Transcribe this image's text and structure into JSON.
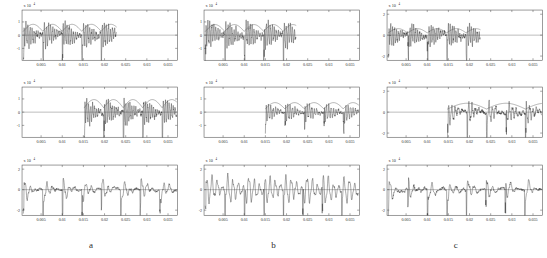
{
  "figure": {
    "columns": [
      {
        "label": "a"
      },
      {
        "label": "b"
      },
      {
        "label": "c"
      }
    ]
  },
  "axis": {
    "x_ticks": [
      "0.005",
      "0.01",
      "0.015",
      "0.02",
      "0.025",
      "0.03",
      "0.035"
    ],
    "x_tick_values": [
      0.005,
      0.01,
      0.015,
      0.02,
      0.025,
      0.03,
      0.035
    ],
    "xlim": [
      0.0005,
      0.0372
    ],
    "y_multiplier": "x 10",
    "y_exponent": "4",
    "y_ticks_pm1": [
      "1",
      "0",
      "-1"
    ],
    "y_ticks_pm2": [
      "2",
      "0",
      "-2"
    ]
  },
  "chart_data": [
    {
      "id": "a1",
      "type": "line",
      "title": "",
      "xlabel": "",
      "ylabel": "",
      "xlim": [
        0.0005,
        0.0372
      ],
      "ylim": [
        -1.9,
        1.9
      ],
      "ytick_labels": [
        "1",
        "0",
        "-1"
      ],
      "ytick_values": [
        1,
        0,
        -1
      ],
      "xtick_labels": [
        "0.005",
        "0.01",
        "0.015",
        "0.02",
        "0.025",
        "0.03",
        "0.035"
      ],
      "y_multiplier_text": "x 10",
      "y_exponent_text": "4",
      "grid": false,
      "legend": null,
      "series": [
        {
          "name": "signal",
          "span": [
            0.0008,
            0.0228
          ],
          "amplitude": 1.45,
          "carrier_hz": 2050,
          "impulse_period": 0.0046,
          "decay": 0.45,
          "noise": 0.3
        },
        {
          "name": "envelope",
          "span": [
            0.0008,
            0.0228
          ],
          "amplitude": 0.82,
          "lobe_period": 0.0046
        }
      ]
    },
    {
      "id": "a2",
      "type": "line",
      "xlim": [
        0.0005,
        0.0372
      ],
      "ylim": [
        -1.9,
        1.9
      ],
      "ytick_labels": [
        "1",
        "0",
        "-1"
      ],
      "ytick_values": [
        1,
        0,
        -1
      ],
      "xtick_labels": [
        "0.005",
        "0.01",
        "0.015",
        "0.02",
        "0.025",
        "0.03",
        "0.035"
      ],
      "y_multiplier_text": "x 10",
      "y_exponent_text": "4",
      "grid": false,
      "series": [
        {
          "name": "signal",
          "span": [
            0.0152,
            0.037
          ],
          "amplitude": 1.5,
          "carrier_hz": 2150,
          "impulse_period": 0.0046,
          "decay": 0.4,
          "noise": 0.32
        },
        {
          "name": "envelope",
          "span": [
            0.0152,
            0.037
          ],
          "amplitude": 0.95,
          "lobe_period": 0.0046
        }
      ]
    },
    {
      "id": "a3",
      "type": "line",
      "xlim": [
        0.0005,
        0.0372
      ],
      "ylim": [
        -2.5,
        2.4
      ],
      "ytick_labels": [
        "2",
        "0",
        "-2"
      ],
      "ytick_values": [
        2,
        0,
        -2
      ],
      "xtick_labels": [
        "0.005",
        "0.01",
        "0.015",
        "0.02",
        "0.025",
        "0.03",
        "0.035"
      ],
      "y_multiplier_text": "x 10",
      "y_exponent_text": "4",
      "grid": false,
      "series": [
        {
          "name": "signal",
          "span": [
            0.0008,
            0.037
          ],
          "amplitude": 1.85,
          "carrier_hz": 760,
          "impulse_period": 0.0046,
          "decay": 0.25,
          "noise": 0.26
        }
      ]
    },
    {
      "id": "b1",
      "type": "line",
      "xlim": [
        0.0005,
        0.0372
      ],
      "ylim": [
        -1.9,
        1.9
      ],
      "ytick_labels": [
        "1",
        "0",
        "-1"
      ],
      "ytick_values": [
        1,
        0,
        -1
      ],
      "xtick_labels": [
        "0.005",
        "0.01",
        "0.015",
        "0.02",
        "0.025",
        "0.03",
        "0.035"
      ],
      "y_multiplier_text": "x 10",
      "y_exponent_text": "4",
      "grid": false,
      "series": [
        {
          "name": "signal",
          "span": [
            0.0008,
            0.0222
          ],
          "amplitude": 1.48,
          "carrier_hz": 2100,
          "impulse_period": 0.0046,
          "decay": 0.46,
          "noise": 0.3
        },
        {
          "name": "envelope",
          "span": [
            0.0008,
            0.0222
          ],
          "amplitude": 0.8,
          "lobe_period": 0.0046
        }
      ]
    },
    {
      "id": "b2",
      "type": "line",
      "xlim": [
        0.0005,
        0.0372
      ],
      "ylim": [
        -1.9,
        1.9
      ],
      "ytick_labels": [
        "1",
        "0",
        "-1"
      ],
      "ytick_values": [
        1,
        0,
        -1
      ],
      "xtick_labels": [
        "0.005",
        "0.01",
        "0.015",
        "0.02",
        "0.025",
        "0.03",
        "0.035"
      ],
      "y_multiplier_text": "x 10",
      "y_exponent_text": "4",
      "grid": false,
      "series": [
        {
          "name": "signal",
          "span": [
            0.015,
            0.037
          ],
          "amplitude": 1.1,
          "carrier_hz": 1750,
          "impulse_period": 0.0046,
          "decay": 0.38,
          "noise": 0.24
        },
        {
          "name": "envelope",
          "span": [
            0.015,
            0.037
          ],
          "amplitude": 0.72,
          "lobe_period": 0.0046
        }
      ]
    },
    {
      "id": "b3",
      "type": "line",
      "xlim": [
        0.0005,
        0.0372
      ],
      "ylim": [
        -2.5,
        2.4
      ],
      "ytick_labels": [
        "2",
        "0",
        "-2"
      ],
      "ytick_values": [
        2,
        0,
        -2
      ],
      "xtick_labels": [
        "0.005",
        "0.01",
        "0.015",
        "0.02",
        "0.025",
        "0.03",
        "0.035"
      ],
      "y_multiplier_text": "x 10",
      "y_exponent_text": "4",
      "grid": false,
      "series": [
        {
          "name": "signal",
          "span": [
            0.0008,
            0.037
          ],
          "amplitude": 1.95,
          "carrier_hz": 800,
          "impulse_period": 0.0046,
          "decay": 0.6,
          "noise": 0.24
        }
      ]
    },
    {
      "id": "c1",
      "type": "line",
      "xlim": [
        0.0005,
        0.0372
      ],
      "ylim": [
        -2.4,
        2.4
      ],
      "ytick_labels": [
        "2",
        "0",
        "-2"
      ],
      "ytick_values": [
        2,
        0,
        -2
      ],
      "xtick_labels": [
        "0.005",
        "0.01",
        "0.015",
        "0.02",
        "0.025",
        "0.03",
        "0.035"
      ],
      "y_multiplier_text": "x 10",
      "y_exponent_text": "4",
      "grid": false,
      "series": [
        {
          "name": "signal",
          "span": [
            0.0008,
            0.0225
          ],
          "amplitude": 1.6,
          "carrier_hz": 2200,
          "impulse_period": 0.0046,
          "decay": 0.44,
          "noise": 0.34
        },
        {
          "name": "envelope",
          "span": [
            0.0008,
            0.0225
          ],
          "amplitude": 0.62,
          "lobe_period": 0.0046
        }
      ]
    },
    {
      "id": "c2",
      "type": "line",
      "xlim": [
        0.0005,
        0.0372
      ],
      "ylim": [
        -2.4,
        2.4
      ],
      "ytick_labels": [
        "2",
        "0",
        "-2"
      ],
      "ytick_values": [
        2,
        0,
        -2
      ],
      "xtick_labels": [
        "0.005",
        "0.01",
        "0.015",
        "0.02",
        "0.025",
        "0.03",
        "0.035"
      ],
      "y_multiplier_text": "x 10",
      "y_exponent_text": "4",
      "grid": false,
      "series": [
        {
          "name": "signal",
          "span": [
            0.0148,
            0.037
          ],
          "amplitude": 1.8,
          "carrier_hz": 1250,
          "impulse_period": 0.0046,
          "decay": 0.3,
          "noise": 0.3
        },
        {
          "name": "envelope",
          "span": [
            0.0148,
            0.037
          ],
          "amplitude": 0.85,
          "lobe_period": 0.0092
        }
      ]
    },
    {
      "id": "c3",
      "type": "line",
      "xlim": [
        0.0005,
        0.0372
      ],
      "ylim": [
        -2.5,
        2.4
      ],
      "ytick_labels": [
        "2",
        "0",
        "-2"
      ],
      "ytick_values": [
        2,
        0,
        -2
      ],
      "xtick_labels": [
        "0.005",
        "0.01",
        "0.015",
        "0.02",
        "0.025",
        "0.03",
        "0.035"
      ],
      "y_multiplier_text": "x 10",
      "y_exponent_text": "4",
      "grid": false,
      "series": [
        {
          "name": "signal",
          "span": [
            0.0008,
            0.037
          ],
          "amplitude": 1.95,
          "carrier_hz": 700,
          "impulse_period": 0.0046,
          "decay": 0.22,
          "noise": 0.3
        }
      ]
    }
  ],
  "colors": {
    "axis": "#4d4d4d",
    "trace": "#2b2b2b",
    "envelope": "#4a4a4a",
    "zero_line": "#7a7a7a",
    "text": "#2a2a2a",
    "background": "#ffffff"
  }
}
